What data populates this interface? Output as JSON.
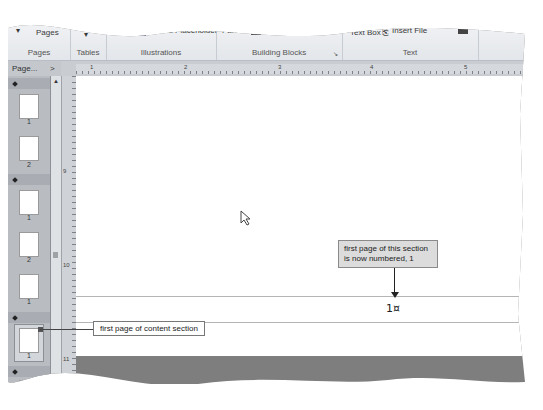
{
  "ribbon": {
    "groups": [
      {
        "name": "Pages",
        "items": [
          "Pages"
        ]
      },
      {
        "name": "Tables",
        "items": [
          "Table"
        ]
      },
      {
        "name": "Illustrations",
        "items": [
          "Picture",
          "Picture Placeholder"
        ]
      },
      {
        "name": "Building Blocks",
        "items": [
          "Parts",
          "Advertisements"
        ]
      },
      {
        "name": "Text",
        "items": [
          "Text Box",
          "Insert File"
        ]
      },
      {
        "name": "",
        "items": [
          "Hyp"
        ]
      }
    ],
    "building_blocks_launcher": "launcher-icon"
  },
  "ruler": {
    "h_ticks": [
      "1",
      "2",
      "3",
      "4",
      "5"
    ],
    "v_ticks": [
      "9",
      "10",
      "11"
    ]
  },
  "nav_pane": {
    "header": "Page...",
    "collapse_glyph": ">",
    "sections": [
      {
        "pages": [
          "1",
          "2"
        ]
      },
      {
        "pages": [
          "1",
          "2",
          "3"
        ]
      },
      {
        "pages": [
          "1"
        ],
        "selected": "1"
      },
      {
        "pages": [
          ""
        ]
      }
    ]
  },
  "document": {
    "page_number": "1¤"
  },
  "callouts": {
    "top": "first page of this section is now numbered, 1",
    "bottom": "first page of content section"
  }
}
